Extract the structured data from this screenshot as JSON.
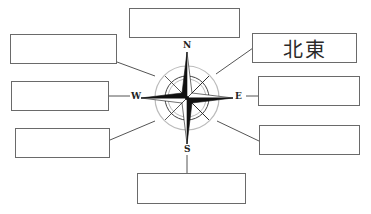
{
  "diagram": {
    "type": "compass-rose-worksheet",
    "compass": {
      "labels": {
        "north": "N",
        "south": "S",
        "east": "E",
        "west": "W"
      }
    },
    "boxes": {
      "north": {
        "text": ""
      },
      "northwest": {
        "text": ""
      },
      "west": {
        "text": ""
      },
      "southwest": {
        "text": ""
      },
      "south": {
        "text": ""
      },
      "northeast": {
        "text": "北東"
      },
      "east": {
        "text": ""
      },
      "southeast": {
        "text": ""
      }
    }
  }
}
